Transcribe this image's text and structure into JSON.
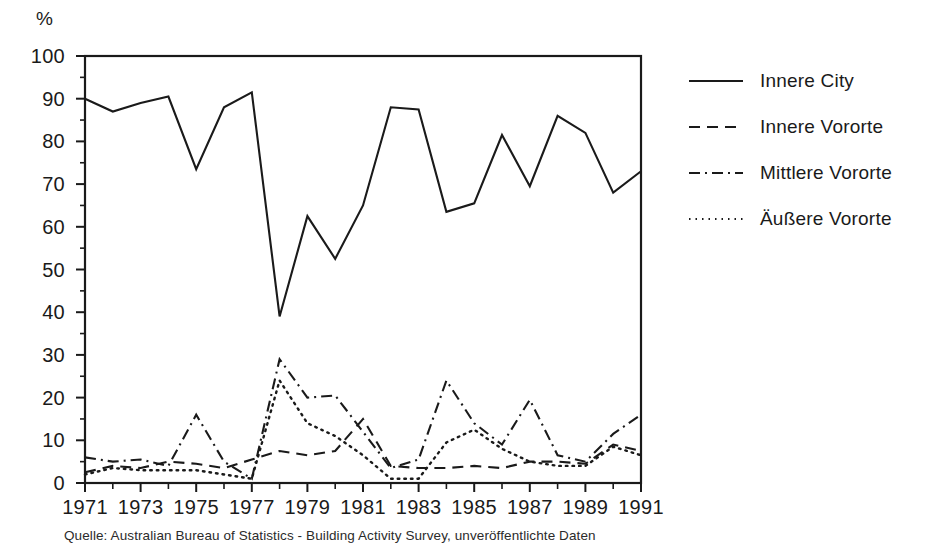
{
  "chart_data": {
    "type": "line",
    "title": "",
    "subtitle": "",
    "xlabel": "",
    "ylabel": "%",
    "ylim": [
      0,
      100
    ],
    "xlim": [
      1971,
      1991
    ],
    "ytick_step": 10,
    "yticks": [
      0,
      10,
      20,
      30,
      40,
      50,
      60,
      70,
      80,
      90,
      100
    ],
    "y_minor_step": 5,
    "grid": false,
    "legend_position": "right",
    "x": [
      1971,
      1972,
      1973,
      1974,
      1975,
      1976,
      1977,
      1978,
      1979,
      1980,
      1981,
      1982,
      1983,
      1984,
      1985,
      1986,
      1987,
      1988,
      1989,
      1990,
      1991
    ],
    "xticks": [
      1971,
      1973,
      1975,
      1977,
      1979,
      1981,
      1983,
      1985,
      1987,
      1989,
      1991
    ],
    "xtick_labels": [
      "1971",
      "1973",
      "1975",
      "1977",
      "1979",
      "1981",
      "1983",
      "1985",
      "1987",
      "1989",
      "1991"
    ],
    "x_minor_ticks": [
      1972,
      1974,
      1976,
      1978,
      1980,
      1982,
      1984,
      1986,
      1988,
      1990
    ],
    "series": [
      {
        "name": "Innere City",
        "style": "solid",
        "color": "#1a1a1a",
        "values": [
          90.0,
          87.0,
          89.0,
          90.5,
          73.5,
          88.0,
          91.5,
          39.0,
          62.5,
          52.5,
          65.0,
          88.0,
          87.5,
          63.5,
          65.5,
          81.5,
          69.5,
          86.0,
          82.0,
          68.0,
          73.0
        ]
      },
      {
        "name": "Innere Vororte",
        "style": "dashed",
        "color": "#1a1a1a",
        "values": [
          2.5,
          4.0,
          3.5,
          5.0,
          4.5,
          3.5,
          5.5,
          7.5,
          6.5,
          7.5,
          15.0,
          4.0,
          3.5,
          3.5,
          4.0,
          3.5,
          5.0,
          5.0,
          4.5,
          9.0,
          7.5
        ]
      },
      {
        "name": "Mittlere Vororte",
        "style": "dashdot",
        "color": "#1a1a1a",
        "values": [
          6.0,
          5.0,
          5.5,
          4.0,
          16.0,
          5.0,
          1.0,
          29.0,
          20.0,
          20.5,
          12.0,
          3.5,
          5.5,
          24.0,
          14.0,
          9.0,
          19.5,
          6.5,
          5.0,
          11.5,
          16.0
        ]
      },
      {
        "name": "Äußere Vororte",
        "style": "dotted",
        "color": "#1a1a1a",
        "values": [
          2.0,
          3.5,
          3.0,
          3.0,
          3.0,
          2.0,
          1.0,
          24.0,
          14.0,
          11.0,
          6.5,
          1.0,
          1.0,
          9.5,
          12.5,
          8.0,
          5.0,
          4.0,
          4.0,
          8.5,
          6.5
        ]
      }
    ],
    "source_note": "Quelle: Australian Bureau of Statistics - Building Activity Survey, unveröffentlichte Daten"
  },
  "legend": {
    "items": [
      {
        "label": "Innere City"
      },
      {
        "label": "Innere Vororte"
      },
      {
        "label": "Mittlere Vororte"
      },
      {
        "label": "Äußere Vororte"
      }
    ]
  },
  "axis": {
    "unit": "%"
  }
}
